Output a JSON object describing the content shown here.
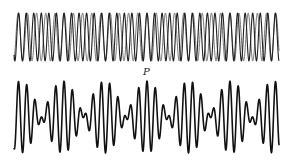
{
  "figure": {
    "label_point": "P",
    "colors": {
      "wave_a": "#222222",
      "wave_b": "#777777",
      "sum": "#111111",
      "background": "#ffffff"
    }
  },
  "chart_data": {
    "type": "line",
    "title": "",
    "xlabel": "",
    "ylabel": "",
    "grid": false,
    "annotations": [
      {
        "text": "P",
        "position": "above bottom waveform at central beat maximum"
      }
    ],
    "panels": [
      {
        "name": "component waves",
        "series": [
          {
            "name": "wave A",
            "amplitude": 1.0,
            "relative_frequency": 1.11,
            "style": "dark line"
          },
          {
            "name": "wave B",
            "amplitude": 1.0,
            "relative_frequency": 0.91,
            "style": "gray line"
          }
        ],
        "cycles_shown_approx": 32
      },
      {
        "name": "resultant (sum)",
        "series": [
          {
            "name": "A + B",
            "beat_maxima_count": 7,
            "beat_period_relative": 5.0
          }
        ]
      }
    ]
  },
  "geometry": {
    "x_start": 14,
    "x_end": 279,
    "top_center_y": 37,
    "top_amp": 24,
    "bottom_center_y": 117,
    "bottom_amp": 36,
    "period_a": 7.55,
    "period_b": 9.2,
    "beat_peak_x": 147,
    "label_x": 143,
    "label_y": 67
  }
}
